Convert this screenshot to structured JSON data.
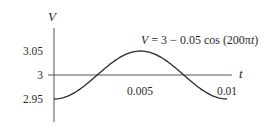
{
  "chart_data": {
    "type": "line",
    "title": "",
    "equation": "V = 3 − 0.05 cos (200πt)",
    "xlabel": "t",
    "ylabel": "V",
    "x_ticks": [
      {
        "value": 0.005,
        "label": "0.005"
      },
      {
        "value": 0.01,
        "label": "0.01"
      }
    ],
    "y_ticks": [
      {
        "value": 3.05,
        "label": "3.05"
      },
      {
        "value": 3,
        "label": "3"
      },
      {
        "value": 2.95,
        "label": "2.95"
      }
    ],
    "xlim": [
      0,
      0.01
    ],
    "ylim": [
      2.95,
      3.05
    ],
    "series": [
      {
        "name": "V(t)",
        "function": "3 - 0.05*cos(200*pi*t)",
        "x": [
          0,
          0.00125,
          0.0025,
          0.00375,
          0.005,
          0.00625,
          0.0075,
          0.00875,
          0.01
        ],
        "values": [
          2.95,
          2.9646,
          3.0,
          3.0354,
          3.05,
          3.0354,
          3.0,
          2.9646,
          2.95
        ]
      }
    ],
    "grid": false,
    "legend": "none",
    "colors": {
      "curve": "#2a2a2a",
      "axes": "#555555",
      "text": "#2a2a2a"
    }
  }
}
